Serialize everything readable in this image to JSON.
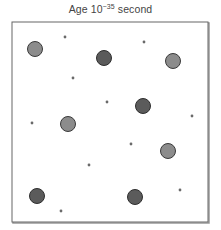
{
  "title": {
    "prefix": "Age 10",
    "exponent": "−35",
    "suffix": " second"
  },
  "diagram": {
    "frame": {
      "x": 12,
      "y": 22,
      "width": 196,
      "height": 200,
      "stroke": "#666666",
      "shadow": "#999999"
    },
    "colors": {
      "dark_fill": "#5b5b5b",
      "dark_stroke": "#2e2e2e",
      "light_fill": "#8c8c8c",
      "light_stroke": "#3a3a3a",
      "dot": "#6a6a6a"
    },
    "large_particles": [
      {
        "x": 35,
        "y": 49,
        "r": 7.5,
        "shade": "light"
      },
      {
        "x": 104,
        "y": 58,
        "r": 7.5,
        "shade": "dark"
      },
      {
        "x": 173,
        "y": 61,
        "r": 7.5,
        "shade": "light"
      },
      {
        "x": 68,
        "y": 124,
        "r": 7.5,
        "shade": "light"
      },
      {
        "x": 143,
        "y": 106,
        "r": 7.5,
        "shade": "dark"
      },
      {
        "x": 168,
        "y": 151,
        "r": 7.5,
        "shade": "light"
      },
      {
        "x": 37,
        "y": 196,
        "r": 7.5,
        "shade": "dark"
      },
      {
        "x": 135,
        "y": 197,
        "r": 7.5,
        "shade": "dark"
      }
    ],
    "small_particles": [
      {
        "x": 65,
        "y": 37
      },
      {
        "x": 144,
        "y": 42
      },
      {
        "x": 73,
        "y": 78
      },
      {
        "x": 107,
        "y": 102
      },
      {
        "x": 32,
        "y": 123
      },
      {
        "x": 192,
        "y": 116
      },
      {
        "x": 131,
        "y": 144
      },
      {
        "x": 89,
        "y": 165
      },
      {
        "x": 180,
        "y": 190
      },
      {
        "x": 61,
        "y": 211
      }
    ]
  }
}
